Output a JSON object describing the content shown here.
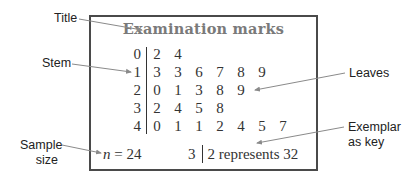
{
  "diagram": {
    "title": "Examination marks",
    "rows": [
      {
        "stem": "0",
        "leaves": [
          "2",
          "4"
        ]
      },
      {
        "stem": "1",
        "leaves": [
          "3",
          "3",
          "6",
          "7",
          "8",
          "9"
        ]
      },
      {
        "stem": "2",
        "leaves": [
          "0",
          "1",
          "3",
          "8",
          "9"
        ]
      },
      {
        "stem": "3",
        "leaves": [
          "2",
          "4",
          "5",
          "8"
        ]
      },
      {
        "stem": "4",
        "leaves": [
          "0",
          "1",
          "1",
          "2",
          "4",
          "5",
          "7"
        ]
      }
    ],
    "sample_size": {
      "symbol": "n",
      "equals": " = ",
      "value": "24"
    },
    "key": {
      "stem": "3",
      "text": "2 represents 32"
    }
  },
  "callouts": {
    "title": "Title",
    "stem": "Stem",
    "leaves": "Leaves",
    "exemplar_line1": "Exemplar",
    "exemplar_line2": "as key",
    "sample_line1": "Sample",
    "sample_line2": "size"
  },
  "colors": {
    "border": "#4a4a4a",
    "title_text": "#7a7a7a",
    "body_text": "#333333",
    "callout_arrow": "#8a8a8a"
  }
}
